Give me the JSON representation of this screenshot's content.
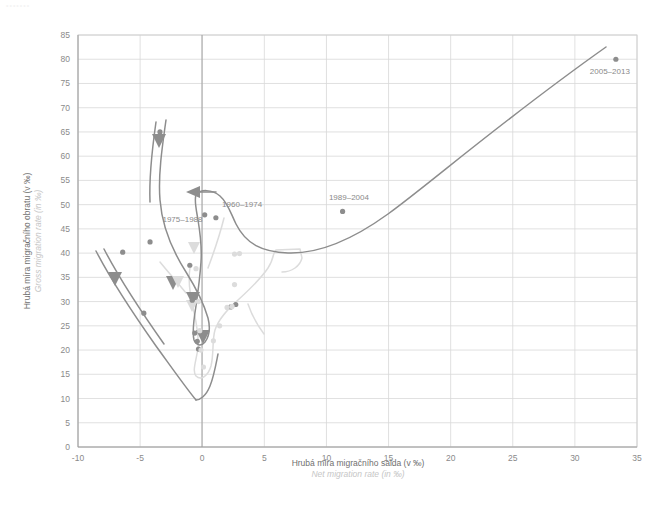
{
  "corner_mark": "•••••••",
  "chart_data": {
    "type": "line",
    "title": "",
    "xlabel": "Hrubá míra migračního salda (v ‰)",
    "xlabel_sub": "Net migration rate (in ‰)",
    "ylabel": "Hrubá míra migračního obratu (v ‰)",
    "ylabel_sub": "Gross migration rate (in ‰)",
    "xlim": [
      -10,
      35
    ],
    "ylim": [
      0,
      85
    ],
    "xticks": [
      -10,
      -5,
      0,
      5,
      10,
      15,
      20,
      25,
      30,
      35
    ],
    "yticks": [
      0,
      5,
      10,
      15,
      20,
      25,
      30,
      35,
      40,
      45,
      50,
      55,
      60,
      65,
      70,
      75,
      80,
      85
    ],
    "grid": true,
    "legend": "none",
    "colors": {
      "dark": "#8d8d8d",
      "light": "#dcdcdc",
      "grid": "#d8d8d8",
      "axis": "#9a9a9a"
    },
    "annotations": [
      {
        "text": "1960–1974",
        "x": 1.6,
        "y": 49.5
      },
      {
        "text": "1975–1988",
        "x": -3.2,
        "y": 46.5
      },
      {
        "text": "1989–2004",
        "x": 10.2,
        "y": 51.0
      },
      {
        "text": "2005–2013",
        "x": 31.2,
        "y": 77.0
      }
    ],
    "series": [
      {
        "name": "dark-trajectory",
        "color": "#8d8d8d",
        "points": [
          {
            "x": -3.4,
            "y": 65.0
          },
          {
            "x": -4.2,
            "y": 42.3
          },
          {
            "x": -4.7,
            "y": 27.6
          },
          {
            "x": -6.4,
            "y": 40.2
          },
          {
            "x": -1.0,
            "y": 37.5
          },
          {
            "x": -0.8,
            "y": 30.3
          },
          {
            "x": -0.6,
            "y": 23.5
          },
          {
            "x": -0.4,
            "y": 21.8
          },
          {
            "x": -0.3,
            "y": 20.2
          },
          {
            "x": 0.2,
            "y": 47.9
          },
          {
            "x": 1.1,
            "y": 47.3
          },
          {
            "x": 2.3,
            "y": 28.9
          },
          {
            "x": 2.7,
            "y": 29.4
          },
          {
            "x": 11.3,
            "y": 48.6
          },
          {
            "x": 33.3,
            "y": 80.0
          }
        ]
      },
      {
        "name": "light-trajectory",
        "color": "#dcdcdc",
        "points": [
          {
            "x": -0.5,
            "y": 36.8
          },
          {
            "x": -0.3,
            "y": 30.0
          },
          {
            "x": -0.2,
            "y": 24.0
          },
          {
            "x": -0.1,
            "y": 20.0
          },
          {
            "x": 0.1,
            "y": 16.5
          },
          {
            "x": 0.9,
            "y": 21.9
          },
          {
            "x": 1.4,
            "y": 25.0
          },
          {
            "x": 2.0,
            "y": 28.8
          },
          {
            "x": 2.4,
            "y": 29.0
          },
          {
            "x": 2.6,
            "y": 33.5
          },
          {
            "x": 2.6,
            "y": 39.8
          },
          {
            "x": 3.0,
            "y": 39.9
          }
        ]
      }
    ]
  }
}
